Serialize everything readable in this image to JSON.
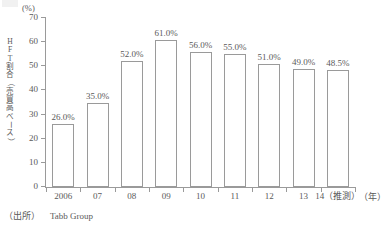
{
  "chart_data": {
    "type": "bar",
    "title": "",
    "subtitle": "",
    "xlabel": "年",
    "ylabel": "HFT割合（売買高ベース）",
    "yunit": "(%)",
    "xunit": "（年）",
    "ylim": [
      0,
      70
    ],
    "ytick_step": 10,
    "grid": false,
    "legend": false,
    "categories": [
      "2006",
      "07",
      "08",
      "09",
      "10",
      "11",
      "12",
      "13",
      "14（推測）"
    ],
    "values": [
      26.0,
      35.0,
      52.0,
      61.0,
      56.0,
      55.0,
      51.0,
      49.0,
      48.5
    ],
    "data_labels": [
      "26.0%",
      "35.0%",
      "52.0%",
      "61.0%",
      "56.0%",
      "55.0%",
      "51.0%",
      "49.0%",
      "48.5%"
    ],
    "ytick_labels": [
      "70",
      "60",
      "50",
      "40",
      "30",
      "20",
      "10",
      "0"
    ],
    "ytick_values": [
      70,
      60,
      50,
      40,
      30,
      20,
      10,
      0
    ],
    "bar_face_color": "#ffffff",
    "bar_edge_color": "#9a9a9a",
    "axis_color": "#9a9a9a",
    "text_color": "#5a5a5a"
  },
  "y_axis_title_chars": [
    "H",
    "F",
    "T",
    "割",
    "合",
    "（",
    "売",
    "買",
    "高",
    "ベ",
    "ー",
    "ス",
    "）"
  ],
  "source": {
    "label": "（出所）",
    "text": "Tabb Group"
  }
}
